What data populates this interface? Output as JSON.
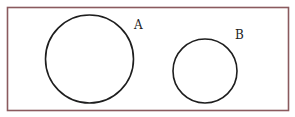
{
  "diagram": {
    "type": "venn-disjoint",
    "frame": {
      "x": 7.5,
      "y": 7.5,
      "width": 281,
      "height": 103,
      "stroke": "#8a5a5e"
    },
    "sets": [
      {
        "label": "A",
        "cx": 89.5,
        "cy": 59,
        "r": 44,
        "label_x": 134,
        "label_y": 29
      },
      {
        "label": "B",
        "cx": 205,
        "cy": 71,
        "r": 32,
        "label_x": 235,
        "label_y": 39
      }
    ],
    "stroke_color": "#1e1e1e",
    "background": "#ffffff"
  }
}
